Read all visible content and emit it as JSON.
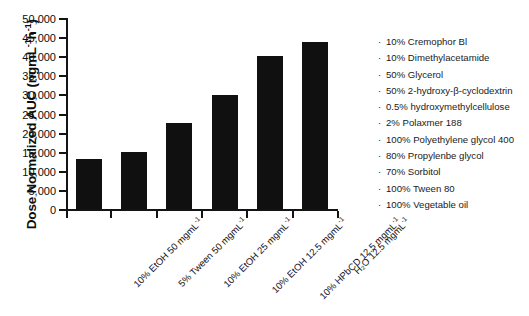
{
  "chart_data": {
    "type": "bar",
    "title": "",
    "xlabel": "",
    "ylabel": "Dose Normalized AUC (ngmL-1h-1)",
    "ylim": [
      0,
      50000
    ],
    "ytick_step": 5000,
    "grid": false,
    "legend_position": "right",
    "categories": [
      "10% EtOH 50 mgmL-1",
      "5% Tween 50 mgmL-1",
      "10% EtOH 25 mgmL-1",
      "10% EtOH 12.5 mgmL-1",
      "10% HPbCD 12.5 mgmL-1",
      "H2O 12.5 mgmL-1"
    ],
    "values": [
      13200,
      15000,
      22500,
      29800,
      40000,
      43800
    ],
    "ytick_labels": [
      "0",
      "5,000",
      "10,000",
      "15,000",
      "20,000",
      "25,000",
      "30,000",
      "35,000",
      "40,000",
      "45,000",
      "50,000"
    ],
    "bar_color": "#101010"
  },
  "axis": {
    "y_title_main": "Dose Normalized AUC (ngmL",
    "y_title_sup1": "-1",
    "y_title_mid": "h",
    "y_title_sup2": "-1",
    "y_title_end": ")"
  },
  "xtick_labels": [
    {
      "main": "10% EtOH 50 mgmL",
      "sup": "-1"
    },
    {
      "main": "5% Tween 50 mgmL",
      "sup": "-1"
    },
    {
      "main": "10% EtOH 25 mgmL",
      "sup": "-1"
    },
    {
      "main": "10% EtOH 12.5 mgmL",
      "sup": "-1"
    },
    {
      "main": "10% HPbCD 12.5 mgmL",
      "sup": "-1"
    },
    {
      "main": "H₂O 12.5 mgmL",
      "sup": "-1"
    }
  ],
  "legend": {
    "bullet": "·",
    "items": [
      "10% Cremophor Bl",
      "10% Dimethylacetamide",
      "50% Glycerol",
      "50% 2-hydroxy-β-cyclodextrin",
      "0.5% hydroxymethylcellulose",
      "2% Polaxmer 188",
      "100% Polyethylene glycol 400",
      "80% Propylenbe glycol",
      "70% Sorbitol",
      "100% Tween 80",
      "100% Vegetable oil"
    ]
  }
}
